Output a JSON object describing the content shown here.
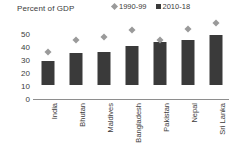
{
  "chart_data": {
    "type": "bar",
    "title": "Percent of GDP",
    "xlabel": "",
    "ylabel": "",
    "ylim": [
      0,
      50
    ],
    "yticks": [
      0,
      10,
      20,
      30,
      40,
      50
    ],
    "grid": false,
    "legend_position": "top-right",
    "categories": [
      "India",
      "Bhutan",
      "Maldives",
      "Bangladesh",
      "Pakistan",
      "Nepal",
      "Sri Lanka"
    ],
    "series": [
      {
        "name": "1990-99",
        "marker": "diamond",
        "color": "#9a9a9a",
        "values": [
          25,
          34.5,
          37,
          42,
          34,
          43,
          47.5
        ]
      },
      {
        "name": "2010-18",
        "marker": "bar",
        "color": "#3a3a3a",
        "values": [
          18,
          24.5,
          25,
          30,
          33,
          34.5,
          38.5
        ]
      }
    ]
  },
  "legend": {
    "items": [
      {
        "label": "1990-99",
        "marker": "diamond-marker-icon"
      },
      {
        "label": "2010-18",
        "marker": "square-marker-icon"
      }
    ]
  },
  "colors": {
    "series_1990_99": "#9a9a9a",
    "series_2010_18": "#3a3a3a",
    "axis": "#8e8e8e",
    "text": "#3b3b3b",
    "background": "#ffffff"
  }
}
